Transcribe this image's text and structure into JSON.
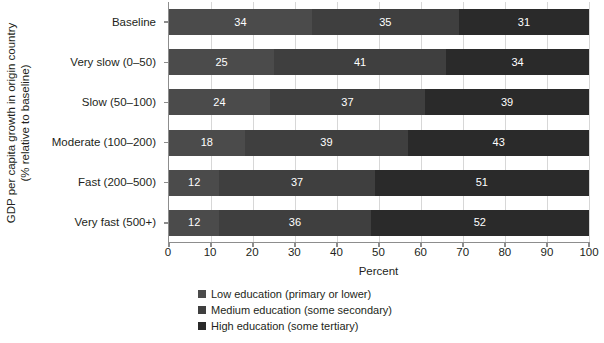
{
  "chart_data": {
    "type": "bar",
    "orientation": "horizontal",
    "stacked": true,
    "normalized_percent": true,
    "title": "",
    "xlabel": "Percent",
    "ylabel_lines": [
      "GDP per capita growth in origin country",
      "(% relative to baseline)"
    ],
    "ylabel": "GDP per capita growth in origin country (% relative to baseline)",
    "xlim": [
      0,
      100
    ],
    "xticks": [
      0,
      10,
      20,
      30,
      40,
      50,
      60,
      70,
      80,
      90,
      100
    ],
    "xticklabels": [
      "0",
      "10",
      "20",
      "30",
      "40",
      "50",
      "60",
      "70",
      "80",
      "90",
      "100"
    ],
    "grid": "vertical",
    "legend_position": "bottom-center",
    "categories": [
      "Baseline",
      "Very slow (0–50)",
      "Slow (50–100)",
      "Moderate (100–200)",
      "Fast (200–500)",
      "Very fast (500+)"
    ],
    "series": [
      {
        "name": "Low education (primary or lower)",
        "color": "#4b4b4b",
        "values": [
          34,
          25,
          24,
          18,
          12,
          12
        ]
      },
      {
        "name": "Medium education (some secondary)",
        "color": "#3f3f3f",
        "values": [
          35,
          41,
          37,
          39,
          37,
          36
        ]
      },
      {
        "name": "High education (some tertiary)",
        "color": "#2a2a2a",
        "values": [
          31,
          34,
          39,
          43,
          51,
          52
        ]
      }
    ]
  },
  "legend": [
    {
      "label": "Low education (primary or lower)",
      "color": "#4b4b4b"
    },
    {
      "label": "Medium education (some secondary)",
      "color": "#3f3f3f"
    },
    {
      "label": "High education (some tertiary)",
      "color": "#2a2a2a"
    }
  ],
  "colors": {
    "axis": "#8d8d8d",
    "grid": "#d7d7d7",
    "text": "#231f20",
    "bar_label": "#ffffff",
    "background": "#ffffff"
  }
}
